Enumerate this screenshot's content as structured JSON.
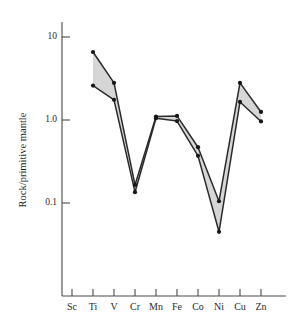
{
  "figure": {
    "background_color": "#ffffff",
    "band_fill_color": "#d2d2d2",
    "line_color": "#2a2a2a",
    "axis_color": "#4a4a4a"
  },
  "axes": {
    "y_title": "Rock/primitive mantle",
    "y_tick_labels": [
      "10",
      "1.0",
      "0.1"
    ],
    "x_tick_labels": [
      "Sc",
      "Ti",
      "V",
      "Cr",
      "Mn",
      "Fe",
      "Co",
      "Ni",
      "Cu",
      "Zn"
    ]
  },
  "chart_data": {
    "type": "line",
    "title": "",
    "xlabel": "",
    "ylabel": "Rock/primitive mantle",
    "yscale": "log",
    "ylim": [
      0.03,
      13
    ],
    "y_ticks": [
      10,
      1.0,
      0.1
    ],
    "y_tick_labels": [
      "10",
      "1.0",
      "0.1"
    ],
    "grid": false,
    "legend": "none",
    "categories": [
      "Sc",
      "Ti",
      "V",
      "Cr",
      "Mn",
      "Fe",
      "Co",
      "Ni",
      "Cu",
      "Zn"
    ],
    "series": [
      {
        "name": "upper envelope",
        "values": [
          null,
          6.6,
          2.8,
          0.165,
          1.1,
          1.12,
          0.47,
          0.105,
          2.8,
          1.25
        ]
      },
      {
        "name": "lower envelope",
        "values": [
          null,
          2.6,
          1.75,
          0.135,
          1.05,
          0.97,
          0.37,
          0.045,
          1.65,
          0.96
        ]
      }
    ],
    "shaded_between_series": true
  }
}
